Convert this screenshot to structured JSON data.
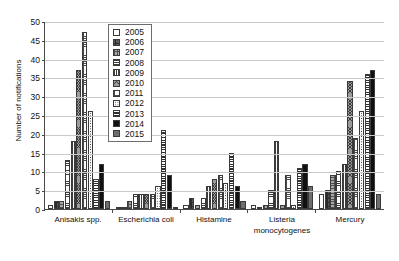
{
  "chart_data": {
    "type": "bar",
    "title": "",
    "xlabel": "",
    "ylabel": "Number of notifications",
    "ylim": [
      0,
      50
    ],
    "ytick_step": 5,
    "yticks": [
      0,
      5,
      10,
      15,
      20,
      25,
      30,
      35,
      40,
      45,
      50
    ],
    "grid": true,
    "legend_position": "top-center-inside",
    "categories": [
      "Anisakis spp.",
      "Escherichia coli",
      "Histamine",
      "Listeria monocytogenes",
      "Mercury"
    ],
    "series": [
      {
        "name": "2005",
        "pattern": "blank-white",
        "values": [
          1,
          0,
          1,
          1,
          4
        ]
      },
      {
        "name": "2006",
        "pattern": "dense-dark-checker",
        "values": [
          2,
          0,
          3,
          0,
          5
        ]
      },
      {
        "name": "2007",
        "pattern": "medium-checker",
        "values": [
          2,
          2,
          1,
          1,
          9
        ]
      },
      {
        "name": "2008",
        "pattern": "horizontal-lines",
        "values": [
          13,
          4,
          3,
          5,
          10
        ]
      },
      {
        "name": "2009",
        "pattern": "vertical-lines",
        "values": [
          18,
          4,
          6,
          18,
          12
        ]
      },
      {
        "name": "2010",
        "pattern": "diagonal-crosshatch",
        "values": [
          37,
          4,
          8,
          1,
          34
        ]
      },
      {
        "name": "2011",
        "pattern": "fine-grid",
        "values": [
          47,
          4,
          9,
          9,
          19
        ]
      },
      {
        "name": "2012",
        "pattern": "sparse-dots",
        "values": [
          26,
          6,
          7,
          1,
          26
        ]
      },
      {
        "name": "2013",
        "pattern": "thick-horizontal-bands",
        "values": [
          8,
          21,
          15,
          11,
          36
        ]
      },
      {
        "name": "2014",
        "pattern": "solid-black",
        "values": [
          12,
          9,
          6,
          12,
          37
        ]
      },
      {
        "name": "2015",
        "pattern": "solid-grey",
        "values": [
          2,
          0,
          2,
          6,
          4
        ]
      }
    ]
  },
  "axis": {
    "y_title": "Number of notifications"
  }
}
